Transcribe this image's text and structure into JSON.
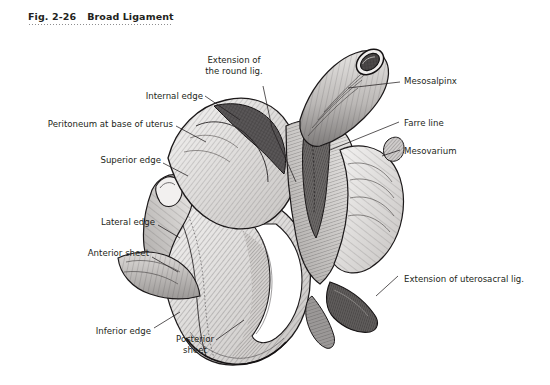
{
  "figure": {
    "number": "Fig. 2-26",
    "title": "Broad Ligament"
  },
  "illustration": {
    "subject": "broad-ligament-anatomical-drawing",
    "style": "pen-and-ink-hatched",
    "ink_color": "#231f20",
    "fill_light": "#e8e6e4",
    "fill_mid": "#b9b6b4",
    "fill_dark": "#6f6c6b"
  },
  "labels": [
    {
      "id": "extension-round-lig",
      "line1": "Extension of",
      "line2": "the round lig."
    },
    {
      "id": "internal-edge",
      "line1": "Internal edge",
      "line2": ""
    },
    {
      "id": "peritoneum-base-uterus",
      "line1": "Peritoneum at base of uterus",
      "line2": ""
    },
    {
      "id": "superior-edge",
      "line1": "Superior edge",
      "line2": ""
    },
    {
      "id": "lateral-edge",
      "line1": "Lateral edge",
      "line2": ""
    },
    {
      "id": "anterior-sheet",
      "line1": "Anterior sheet",
      "line2": ""
    },
    {
      "id": "inferior-edge",
      "line1": "Inferior edge",
      "line2": ""
    },
    {
      "id": "posterior-sheet",
      "line1": "Posterior",
      "line2": "sheet"
    },
    {
      "id": "mesosalpinx",
      "line1": "Mesosalpinx",
      "line2": ""
    },
    {
      "id": "farre-line",
      "line1": "Farre line",
      "line2": ""
    },
    {
      "id": "mesovarium",
      "line1": "Mesovarium",
      "line2": ""
    },
    {
      "id": "extension-uterosacral-lig",
      "line1": "Extension of uterosacral lig.",
      "line2": ""
    }
  ]
}
